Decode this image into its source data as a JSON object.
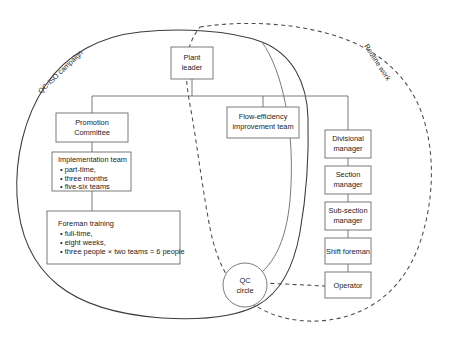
{
  "diagram": {
    "envelopes": [
      {
        "id": "campaign",
        "label": "QC-ISO campaign",
        "style": "solid"
      },
      {
        "id": "routine",
        "label": "Routine work",
        "style": "dashed"
      }
    ],
    "nodes": {
      "plant_leader": {
        "label_line1": "Plant",
        "label_line2": "leader"
      },
      "promotion_committee": {
        "label_line1": "Promotion",
        "label_line2": "Committee"
      },
      "flow_efficiency_team": {
        "label_line1": "Flow-efficiency",
        "label_line2": "improvement team"
      },
      "implementation_team": {
        "title": "Implementation team",
        "items": [
          "• part-time,",
          "• three months",
          "• five-six teams"
        ]
      },
      "foreman_training": {
        "title": "Foreman training",
        "items": [
          "• full-time,",
          "• eight weeks,",
          "• three people × two teams = 6 people"
        ]
      },
      "divisional_manager": {
        "label_line1": "Divisional",
        "label_line2": "manager"
      },
      "section_manager": {
        "label_line1": "Section",
        "label_line2": "manager"
      },
      "sub_section_manager": {
        "label_line1": "Sub-section",
        "label_line2": "manager"
      },
      "shift_foreman": {
        "label_line1": "Shift foreman",
        "label_line2": ""
      },
      "operator": {
        "label_line1": "Operator",
        "label_line2": ""
      },
      "qc_circle": {
        "label_line1": "QC",
        "label_line2": "circle"
      }
    },
    "colors": {
      "box_stroke": "#6b6b6b",
      "envelope_solid": "#3a3a3a",
      "envelope_dashed": "#4a4a4a",
      "text": "#1b1b1b",
      "background": "#ffffff"
    }
  }
}
